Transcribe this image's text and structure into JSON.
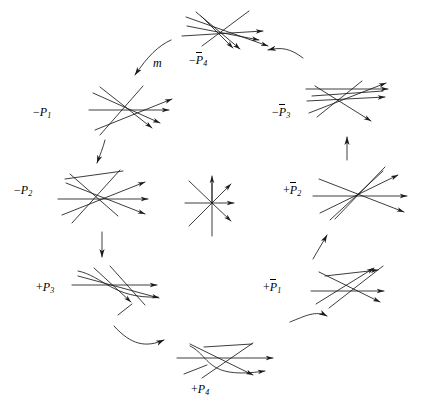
{
  "figure": {
    "type": "diagram",
    "background_color": "#ffffff",
    "stroke_color": "#1a1a1a",
    "width": 422,
    "height": 420
  },
  "center_node": {
    "name": "central-arrangement",
    "label": "",
    "description": "simple arrangement of 4 concurrent pseudolines (8 rays) with arrowheads on up, upper-right, right and lower-right rays",
    "cx": 212,
    "cy": 203,
    "line_count": 4
  },
  "nodes": [
    {
      "id": "minus-P4-bar",
      "label_sign": "−",
      "label_var": "P",
      "label_bar": true,
      "label_sub": "4",
      "label_text": "−P̄4",
      "label_x": 189,
      "label_y": 60,
      "cx": 228,
      "cy": 38,
      "position": "top"
    },
    {
      "id": "minus-P3-bar",
      "label_sign": "−",
      "label_var": "P",
      "label_bar": true,
      "label_sub": "3",
      "label_text": "−P̄3",
      "label_x": 272,
      "label_y": 112,
      "cx": 347,
      "cy": 107,
      "position": "upper-right"
    },
    {
      "id": "plus-P2-bar",
      "label_sign": "+",
      "label_var": "P",
      "label_bar": true,
      "label_sub": "2",
      "label_text": "+P̄2",
      "label_x": 283,
      "label_y": 190,
      "cx": 356,
      "cy": 196,
      "position": "right"
    },
    {
      "id": "plus-P1-bar",
      "label_sign": "+",
      "label_var": "P",
      "label_bar": true,
      "label_sub": "1",
      "label_text": "+P̄1",
      "label_x": 263,
      "label_y": 287,
      "cx": 347,
      "cy": 290,
      "position": "lower-right"
    },
    {
      "id": "plus-P4",
      "label_sign": "+",
      "label_var": "P",
      "label_bar": false,
      "label_sub": "4",
      "label_text": "+P4",
      "label_x": 191,
      "label_y": 389,
      "cx": 221,
      "cy": 360,
      "position": "bottom"
    },
    {
      "id": "plus-P3",
      "label_sign": "+",
      "label_var": "P",
      "label_bar": false,
      "label_sub": "3",
      "label_text": "+P3",
      "label_x": 36,
      "label_y": 287,
      "cx": 113,
      "cy": 288,
      "position": "lower-left"
    },
    {
      "id": "minus-P2",
      "label_sign": "−",
      "label_var": "P",
      "label_bar": false,
      "label_sub": "2",
      "label_text": "−P2",
      "label_x": 14,
      "label_y": 190,
      "cx": 101,
      "cy": 196,
      "position": "left"
    },
    {
      "id": "minus-P1",
      "label_sign": "−",
      "label_var": "P",
      "label_bar": false,
      "label_sub": "1",
      "label_text": "−P1",
      "label_x": 33,
      "label_y": 112,
      "cx": 124,
      "cy": 107,
      "position": "upper-left"
    }
  ],
  "edge_label": {
    "id": "m-label",
    "text": "m",
    "x": 153,
    "y": 63
  },
  "edges": [
    {
      "id": "edge-P1-to-P2",
      "from": "minus-P1",
      "to": "minus-P2",
      "style": "straight-arrow"
    },
    {
      "id": "edge-P2-to-P3",
      "from": "minus-P2",
      "to": "plus-P3",
      "style": "straight-arrow"
    },
    {
      "id": "edge-P3-to-P4",
      "from": "plus-P3",
      "to": "plus-P4",
      "style": "curved-arrow"
    },
    {
      "id": "edge-P4-to-P1b",
      "from": "plus-P4",
      "to": "plus-P1-bar",
      "style": "curved-arrow"
    },
    {
      "id": "edge-P1b-to-P2b",
      "from": "plus-P1-bar",
      "to": "plus-P2-bar",
      "style": "straight-arrow"
    },
    {
      "id": "edge-P2b-to-P3b",
      "from": "plus-P2-bar",
      "to": "minus-P3-bar",
      "style": "straight-arrow"
    },
    {
      "id": "edge-P3b-to-P4b",
      "from": "minus-P3-bar",
      "to": "minus-P4-bar",
      "style": "curved-arrow"
    },
    {
      "id": "edge-P4b-to-P1",
      "from": "minus-P4-bar",
      "to": "minus-P1",
      "style": "curved-arrow-m"
    }
  ]
}
